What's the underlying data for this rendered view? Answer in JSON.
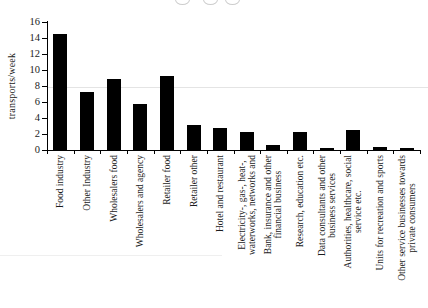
{
  "figure": {
    "background": "#ffffff",
    "top_edge_artifact": "three faint illegible cut-off character fragments along the top edge",
    "scan_artifact_lines": 2
  },
  "chart_data": {
    "type": "bar",
    "title": "",
    "xlabel": "",
    "ylabel": "transports/week",
    "ylim": [
      0,
      16
    ],
    "yticks": [
      0,
      2,
      4,
      6,
      8,
      10,
      12,
      14,
      16
    ],
    "grid": false,
    "legend": "none",
    "bar_color": "#000000",
    "categories": [
      "Food industry",
      "Other Industry",
      "Wholesalers food",
      "Wholesalers and agency",
      "Retailer food",
      "Retailer other",
      "Hotel and restaurant",
      "Electricity-, gas-, heat-,\nwaterworks, networks and",
      "Bank, insurance and other\nfinancial business",
      "Research, education etc.",
      "Data consultants and other\nbusiness services",
      "Authorities, healthcare, social\nservice etc.",
      "Units for recreation and sports",
      "Other service businesses towards\nprivate consumers"
    ],
    "values": [
      14.5,
      7.3,
      8.9,
      5.8,
      9.2,
      3.1,
      2.8,
      2.3,
      0.6,
      2.2,
      0.3,
      2.5,
      0.4,
      0.2
    ]
  }
}
